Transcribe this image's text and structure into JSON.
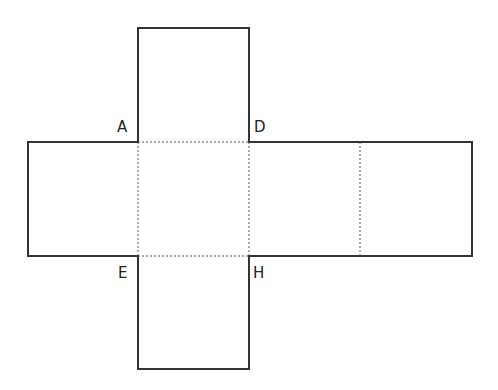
{
  "diagram": {
    "type": "cube-net",
    "colors": {
      "solid_edge": "#333333",
      "fold_line": "#555555",
      "background": "#ffffff"
    },
    "labels": [
      {
        "id": "A",
        "text": "A"
      },
      {
        "id": "D",
        "text": "D"
      },
      {
        "id": "E",
        "text": "E"
      },
      {
        "id": "H",
        "text": "H"
      }
    ]
  }
}
